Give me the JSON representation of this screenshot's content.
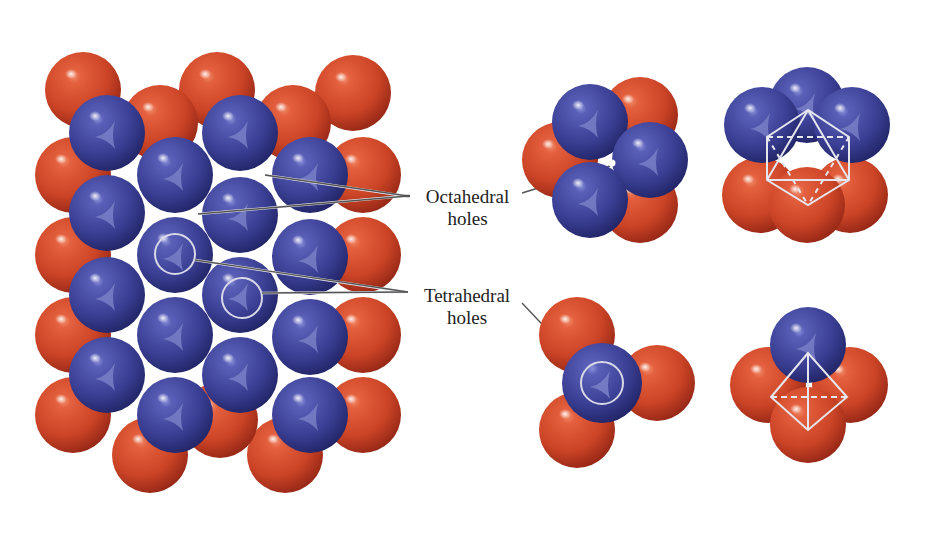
{
  "figure": {
    "type": "close-packed sphere layers diagram",
    "labels": {
      "octahedral": [
        "Octahedral",
        "holes"
      ],
      "tetrahedral": [
        "Tetrahedral",
        "holes"
      ]
    },
    "colors": {
      "red_sphere": "#d2472a",
      "red_sphere_dark": "#8e2314",
      "blue_sphere": "#3a3f94",
      "blue_sphere_dark": "#1e2160",
      "leader_line": "#555555",
      "background": "#ffffff"
    },
    "panels": [
      {
        "name": "stacked-layers",
        "description": "Two close-packed layers: red (lower) and blue (upper)"
      },
      {
        "name": "octahedral-hole-top-view",
        "description": "3 red + 3 blue spheres around octahedral hole"
      },
      {
        "name": "octahedral-hole-side-view",
        "description": "Octahedron outlined among 6 spheres"
      },
      {
        "name": "tetrahedral-hole-top-view",
        "description": "1 blue over 3 red spheres, hole circled"
      },
      {
        "name": "tetrahedral-hole-side-view",
        "description": "Tetrahedron outlined among 4 spheres"
      }
    ]
  }
}
